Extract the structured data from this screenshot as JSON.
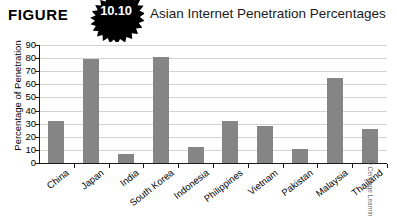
{
  "header": {
    "figure_word": "FIGURE",
    "figure_number": "10.10",
    "badge_icon": "starburst-badge-icon",
    "title": "Asian Internet Penetration Percentages"
  },
  "credit": "© Cengage Learning",
  "colors": {
    "bar": "#858585",
    "gridline": "#d2d2d2",
    "axis": "#1a1a1a",
    "badge": "#000000",
    "background": "#ffffff",
    "text": "#000000"
  },
  "chart_data": {
    "type": "bar",
    "title": "Asian Internet Penetration Percentages",
    "xlabel": "",
    "ylabel": "Percentage of Penetration",
    "ylim": [
      0,
      90
    ],
    "yticks": [
      0,
      10,
      20,
      30,
      40,
      50,
      60,
      70,
      80,
      90
    ],
    "ytick_labels": [
      "0",
      "10",
      "20",
      "30",
      "40",
      "50",
      "60",
      "70",
      "80",
      "90"
    ],
    "grid": true,
    "legend": false,
    "categories": [
      "China",
      "Japan",
      "India",
      "South Korea",
      "Indonesia",
      "Philippines",
      "Vietnam",
      "Pakistan",
      "Malaysia",
      "Thailand"
    ],
    "values": [
      32,
      79,
      7,
      81,
      12,
      32,
      28,
      11,
      65,
      26
    ]
  }
}
